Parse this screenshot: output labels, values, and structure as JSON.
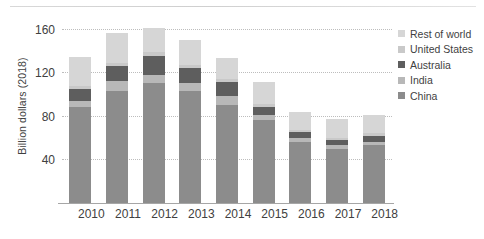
{
  "chart_data": {
    "type": "bar",
    "subtype": "stacked-bar",
    "title": "",
    "xlabel": "",
    "ylabel": "Billion dollars (2018)",
    "categories": [
      "2010",
      "2011",
      "2012",
      "2013",
      "2014",
      "2015",
      "2016",
      "2017",
      "2018"
    ],
    "ylim": [
      0,
      170
    ],
    "yticks": [
      40,
      80,
      120,
      160
    ],
    "ytick_labels": [
      "40",
      "80",
      "120",
      "160"
    ],
    "grid": "horizontal-dotted",
    "legend_position": "right",
    "series": [
      {
        "name": "China",
        "color": "#8c8c8c",
        "values": [
          88,
          103,
          110,
          103,
          90,
          76,
          56,
          50,
          53
        ]
      },
      {
        "name": "India",
        "color": "#b8b8b8",
        "values": [
          6,
          9,
          8,
          7,
          8,
          5,
          4,
          3,
          3
        ]
      },
      {
        "name": "Australia",
        "color": "#5e5e5e",
        "values": [
          11,
          14,
          17,
          14,
          13,
          7,
          5,
          5,
          6
        ]
      },
      {
        "name": "United States",
        "color": "#c9c9c9",
        "values": [
          3,
          3,
          4,
          3,
          3,
          3,
          2,
          2,
          2
        ]
      },
      {
        "name": "Rest of world",
        "color": "#d6d6d6",
        "values": [
          26,
          27,
          22,
          23,
          19,
          20,
          17,
          17,
          17
        ]
      }
    ],
    "totals": [
      134,
      156,
      161,
      150,
      133,
      111,
      84,
      77,
      81
    ],
    "stack_order_bottom_to_top": [
      "China",
      "India",
      "Australia",
      "United States",
      "Rest of world"
    ],
    "legend_order_top_to_bottom": [
      "Rest of world",
      "United States",
      "Australia",
      "India",
      "China"
    ]
  },
  "colors": {
    "background": "#ffffff",
    "gridline": "#bdbdbd",
    "axis_line": "#a6a6a6",
    "text": "#3f3f3f"
  }
}
